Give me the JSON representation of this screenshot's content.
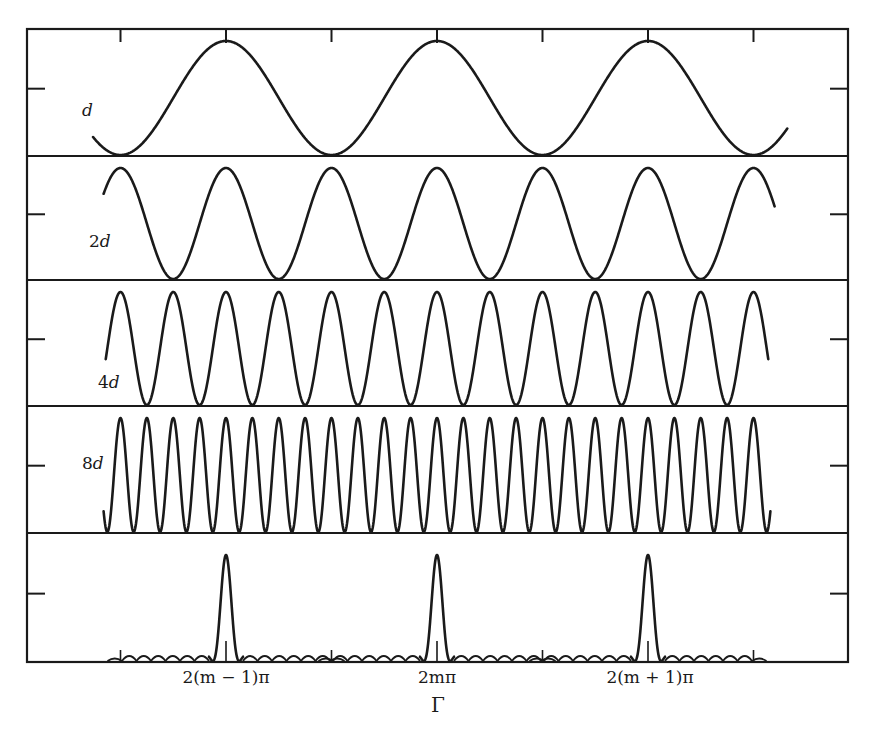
{
  "chart_data": {
    "type": "line",
    "title": "",
    "xlabel": "Γ",
    "ylabel": "",
    "x_ticks": [
      {
        "label": "2(m − 1)π",
        "gamma_over_2pi": -1
      },
      {
        "label": "2mπ",
        "gamma_over_2pi": 0
      },
      {
        "label": "2(m + 1)π",
        "gamma_over_2pi": 1
      }
    ],
    "grid": false,
    "legend": null,
    "panels": [
      {
        "name": "d",
        "label_prefix": "",
        "label_var": "d",
        "frequency_multiplier": 1,
        "shape": "cos^2(N*Γ/2)",
        "x_range_gamma_over_2pi": [
          -1.63,
          1.66
        ]
      },
      {
        "name": "2d",
        "label_prefix": "2",
        "label_var": "d",
        "frequency_multiplier": 2,
        "shape": "cos^2(N*Γ/2)",
        "x_range_gamma_over_2pi": [
          -1.58,
          1.6
        ]
      },
      {
        "name": "4d",
        "label_prefix": "4",
        "label_var": "d",
        "frequency_multiplier": 4,
        "shape": "cos^2(N*Γ/2)",
        "x_range_gamma_over_2pi": [
          -1.57,
          1.57
        ]
      },
      {
        "name": "8d",
        "label_prefix": "8",
        "label_var": "d",
        "frequency_multiplier": 8,
        "shape": "cos^2(N*Γ/2)",
        "x_range_gamma_over_2pi": [
          -1.58,
          1.58
        ]
      },
      {
        "name": "product",
        "label_prefix": "",
        "label_var": "",
        "frequency_multiplier": 0,
        "shape": "product of all above (sharp peaks at Γ = 2mπ with small side lobes)",
        "peaks_at_gamma_over_2pi": [
          -1,
          0,
          1
        ],
        "peak_value": 1.0,
        "side_lobe_count_each_side": 7,
        "side_lobe_relative_height": 0.05
      }
    ],
    "y_range": [
      0,
      1
    ]
  },
  "figure": {
    "labels": {
      "panel_d": {
        "prefix": "",
        "var": "d"
      },
      "panel_2d": {
        "prefix": "2",
        "var": "d"
      },
      "panel_4d": {
        "prefix": "4",
        "var": "d"
      },
      "panel_8d": {
        "prefix": "8",
        "var": "d"
      }
    },
    "x_tick_labels": [
      "2(m − 1)π",
      "2mπ",
      "2(m + 1)π"
    ],
    "x_axis_label": "Γ",
    "ink_color": "#1a1a1a",
    "background_color": "#ffffff"
  }
}
